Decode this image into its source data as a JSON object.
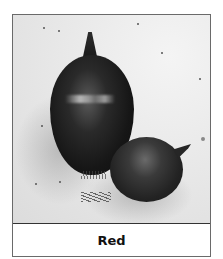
{
  "figure": {
    "image": {
      "description": "Black-and-white photo of two red onions on a light background",
      "tone": "grayscale"
    },
    "caption": "Red"
  }
}
